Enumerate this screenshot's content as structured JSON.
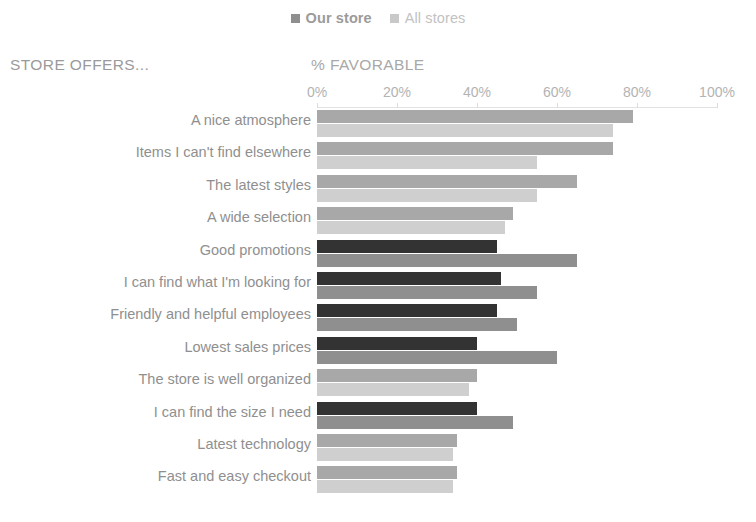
{
  "legend": {
    "entries": [
      {
        "label": "Our store",
        "color": "#8f8f8f"
      },
      {
        "label": "All stores",
        "color": "#c9c9c9"
      }
    ]
  },
  "headers": {
    "left": "STORE OFFERS...",
    "right": "% FAVORABLE"
  },
  "chart_data": {
    "type": "bar",
    "orientation": "horizontal",
    "grouped": true,
    "title": "",
    "xlabel": "% FAVORABLE",
    "ylabel": "STORE OFFERS...",
    "xlim": [
      0,
      100
    ],
    "xticks": [
      0,
      20,
      40,
      60,
      80,
      100
    ],
    "xtick_labels": [
      "0%",
      "20%",
      "40%",
      "60%",
      "80%",
      "100%"
    ],
    "grid": false,
    "legend_position": "top-center",
    "categories": [
      "A nice atmosphere",
      "Items I can't find elsewhere",
      "The latest styles",
      "A wide selection",
      "Good promotions",
      "I can find what I'm looking for",
      "Friendly and helpful employees",
      "Lowest sales prices",
      "The store is well organized",
      "I can find the size I need",
      "Latest technology",
      "Fast and easy checkout"
    ],
    "series": [
      {
        "name": "Our store",
        "values": [
          79,
          74,
          65,
          49,
          45,
          46,
          45,
          40,
          40,
          40,
          35,
          35
        ],
        "highlighted": [
          false,
          false,
          false,
          false,
          true,
          true,
          true,
          true,
          false,
          true,
          false,
          false
        ]
      },
      {
        "name": "All stores",
        "values": [
          74,
          55,
          55,
          47,
          65,
          55,
          50,
          60,
          38,
          49,
          34,
          34
        ]
      }
    ]
  },
  "colors": {
    "bar_highlight": "#333333",
    "bar_primary": "#a8a8a8",
    "bar_secondary": "#cfcfcf",
    "bar_secondary_dark": "#8f8f8f",
    "text": "#8f8f8f",
    "axis": "#e2e2e2",
    "background": "#ffffff"
  }
}
